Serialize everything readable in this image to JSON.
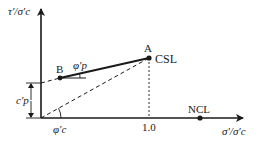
{
  "diagram": {
    "y_axis_label": "τ′/σ′c",
    "x_axis_label": "σ′/σ′c",
    "points": {
      "A": {
        "label": "A",
        "line_label": "CSL"
      },
      "B": {
        "label": "B"
      },
      "NCL": {
        "label": "NCL"
      }
    },
    "tick_x": "1.0",
    "angle_peak": "φ′p",
    "angle_critical": "φ′c",
    "cohesion": "c′p",
    "colors": {
      "ink": "#1a1a1a",
      "background": "#ffffff"
    }
  }
}
